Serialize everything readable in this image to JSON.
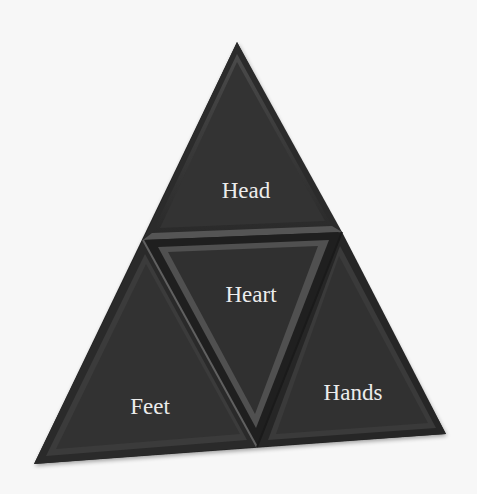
{
  "diagram": {
    "type": "triangle-pyramid",
    "colors": {
      "background": "#f7f7f7",
      "fill": "#333333",
      "bevel_light": "#5a5a5a",
      "bevel_dark": "#1c1c1c",
      "text": "#ececec"
    },
    "segments": [
      {
        "id": "head",
        "label": "Head",
        "position": "top"
      },
      {
        "id": "heart",
        "label": "Heart",
        "position": "center"
      },
      {
        "id": "feet",
        "label": "Feet",
        "position": "bottom-left"
      },
      {
        "id": "hands",
        "label": "Hands",
        "position": "bottom-right"
      }
    ]
  }
}
